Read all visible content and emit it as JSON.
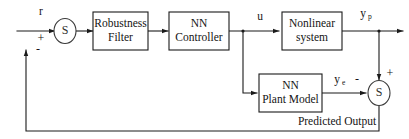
{
  "diagram": {
    "stroke_color": "#1a1a1a",
    "background_color": "#ffffff",
    "blocks": [
      {
        "id": "robustness_filter",
        "line1": "Robustness",
        "line2": "Filter"
      },
      {
        "id": "nn_controller",
        "line1": "NN",
        "line2": "Controller"
      },
      {
        "id": "nonlinear_system",
        "line1": "Nonlinear",
        "line2": "system"
      },
      {
        "id": "nn_plant_model",
        "line1": "NN",
        "line2": "Plant Model"
      }
    ],
    "summing_junctions": [
      {
        "id": "sum_left",
        "symbol": "S",
        "sign_top_input": "+",
        "sign_bottom_input": "-"
      },
      {
        "id": "sum_right",
        "symbol": "S",
        "sign_top_input": "+",
        "sign_left_input": "-"
      }
    ],
    "signals": {
      "reference": "r",
      "control": "u",
      "plant_output_base": "y",
      "plant_output_sub": "p",
      "error_base": "y",
      "error_sub": "e"
    },
    "annotations": {
      "predicted_output": "Predicted Output"
    },
    "signs": {
      "left_sum_plus": "+",
      "left_sum_minus": "-",
      "right_sum_plus": "+",
      "right_sum_minus": "-"
    }
  }
}
